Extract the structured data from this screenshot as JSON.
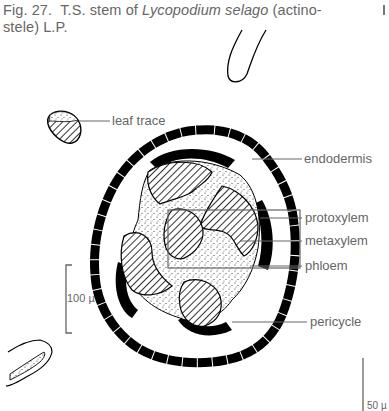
{
  "figure": {
    "number": "Fig. 27.",
    "caption_pre": "T.S. stem of ",
    "caption_species": "Lycopodium selago",
    "caption_post_line1": " (actino-",
    "caption_line2": "stele)  L.P."
  },
  "labels": {
    "leaf_trace": "leaf trace",
    "endodermis": "endodermis",
    "protoxylem": "protoxylem",
    "metaxylem": "metaxylem",
    "phloem": "phloem",
    "pericycle": "pericycle"
  },
  "scale_bars": {
    "left": "100 µ",
    "right": "50 µ"
  },
  "colors": {
    "ink": "#000000",
    "line": "#666666",
    "paper": "#ffffff"
  }
}
